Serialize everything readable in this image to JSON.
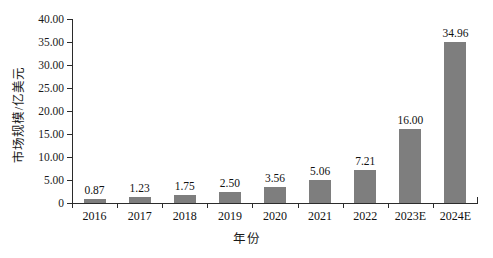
{
  "chart_data": {
    "type": "bar",
    "title": "",
    "subtitle": "",
    "xlabel": "年份",
    "ylabel": "市场规模/亿美元",
    "categories": [
      "2016",
      "2017",
      "2018",
      "2019",
      "2020",
      "2021",
      "2022",
      "2023E",
      "2024E"
    ],
    "values": [
      0.87,
      1.23,
      1.75,
      2.5,
      3.56,
      5.06,
      7.21,
      16.0,
      34.96
    ],
    "value_labels": [
      "0.87",
      "1.23",
      "1.75",
      "2.50",
      "3.56",
      "5.06",
      "7.21",
      "16.00",
      "34.96"
    ],
    "ylim": [
      0,
      40
    ],
    "yticks": [
      0,
      5,
      10,
      15,
      20,
      25,
      30,
      35,
      40
    ],
    "ytick_labels": [
      "0",
      "5.00",
      "10.00",
      "15.00",
      "20.00",
      "25.00",
      "30.00",
      "35.00",
      "40.00"
    ],
    "grid": false,
    "legend": null,
    "legend_position": "none",
    "series": [
      {
        "name": "市场规模",
        "values": [
          0.87,
          1.23,
          1.75,
          2.5,
          3.56,
          5.06,
          7.21,
          16.0,
          34.96
        ],
        "color": "#7e7e7e"
      }
    ],
    "colors": {
      "bar": "#7e7e7e",
      "axis": "#2b2b2b",
      "text": "#111111",
      "background": "#ffffff"
    }
  }
}
